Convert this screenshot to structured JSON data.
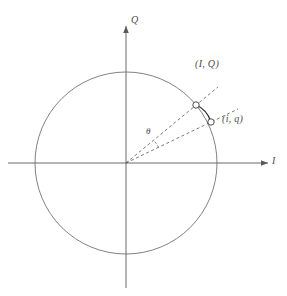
{
  "figure": {
    "type": "iq-constellation-diagram",
    "width": 287,
    "height": 296,
    "background_color": "#ffffff",
    "line_color": "#4a4a4a",
    "circle_color": "#6a6a6a",
    "top_caption": " "
  },
  "axes": {
    "origin": {
      "x": 126,
      "y": 163
    },
    "vertical": {
      "label": "Q",
      "arrow": "up",
      "x": 126,
      "y_top": 22,
      "y_bottom": 288
    },
    "horizontal": {
      "label": "I",
      "arrow": "right",
      "y": 163,
      "x_left": 8,
      "x_right": 272
    }
  },
  "circle": {
    "center_x": 126,
    "center_y": 163,
    "radius": 91,
    "stroke": "#6a6a6a",
    "stroke_width": 0.8,
    "fill": "none"
  },
  "points": [
    {
      "id": "ideal",
      "label": "(I, Q)",
      "x": 196,
      "y": 105,
      "angle_deg": 39.6,
      "marker": "open-circle",
      "marker_radius": 3.2,
      "label_x": 197,
      "label_y": 63
    },
    {
      "id": "measured",
      "label": "(i, q)",
      "x": 211,
      "y": 122,
      "angle_deg": 26.8,
      "marker": "open-circle",
      "marker_radius": 3.2,
      "label_x": 223,
      "label_y": 120
    }
  ],
  "rays": [
    {
      "id": "ray-ideal",
      "from_x": 126,
      "from_y": 163,
      "to_x": 196,
      "to_y": 105,
      "style": "dashed"
    },
    {
      "id": "ray-measured",
      "from_x": 126,
      "from_y": 163,
      "to_x": 211,
      "to_y": 122,
      "style": "dashed"
    },
    {
      "id": "ray-ideal-extension",
      "from_x": 196,
      "from_y": 105,
      "to_x": 218,
      "to_y": 87,
      "style": "dashed"
    },
    {
      "id": "ray-measured-extension",
      "from_x": 211,
      "from_y": 122,
      "to_x": 236,
      "to_y": 110,
      "style": "dashed"
    }
  ],
  "error_arc": {
    "id": "error-vector-arc",
    "from_x": 196,
    "from_y": 105,
    "to_x": 211,
    "to_y": 122,
    "style": "solid",
    "stroke": "#2e2e2e"
  },
  "angle": {
    "symbol": "θ",
    "label_x": 149,
    "label_y": 130,
    "arc_radius": 36,
    "from_angle_deg": 26.8,
    "to_angle_deg": 39.6
  }
}
